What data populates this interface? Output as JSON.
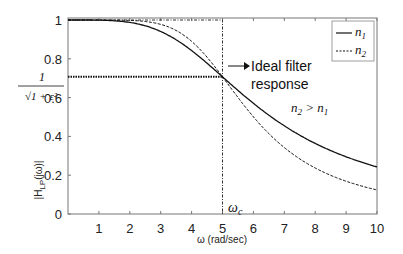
{
  "chart_data": {
    "type": "line",
    "title": "",
    "xlabel": "ω (rad/sec)",
    "ylabel": "|H_LP(jω)|",
    "xlim": [
      0,
      10
    ],
    "ylim": [
      0,
      1
    ],
    "xticks": [
      "1",
      "2",
      "3",
      "4",
      "5",
      "6",
      "7",
      "8",
      "9",
      "10"
    ],
    "yticks": [
      "0",
      "0.2",
      "0.4",
      "0.6",
      "0.8",
      "1"
    ],
    "y_special_label": "1/√(1+ε²)",
    "y_special_value": 0.7071,
    "cutoff_label": "ωc",
    "cutoff_value": 5,
    "grid": false,
    "legend_position": "top-right",
    "series": [
      {
        "name": "n1",
        "order": 2,
        "style": "solid",
        "x": [
          0,
          1,
          2,
          3,
          4,
          5,
          6,
          7,
          8,
          9,
          10
        ],
        "y": [
          1.0,
          0.9992,
          0.9874,
          0.9407,
          0.8421,
          0.7071,
          0.5704,
          0.4544,
          0.3636,
          0.2952,
          0.2425
        ]
      },
      {
        "name": "n2",
        "order": 3,
        "style": "dashed",
        "x": [
          0,
          1,
          2,
          3,
          4,
          5,
          6,
          7,
          8,
          9,
          10
        ],
        "y": [
          1.0,
          1.0,
          0.998,
          0.977,
          0.8896,
          0.7071,
          0.5007,
          0.342,
          0.2373,
          0.1688,
          0.124
        ]
      }
    ],
    "annotations": [
      {
        "text": "Ideal filter",
        "text2": "response",
        "points_to": [
          5,
          0.7071
        ]
      },
      {
        "text": "n2 > n1"
      }
    ],
    "ideal_filter": {
      "passband_gain": 1,
      "cutoff": 5
    }
  },
  "legend": {
    "n1": "n",
    "n1_sub": "1",
    "n2": "n",
    "n2_sub": "2"
  }
}
